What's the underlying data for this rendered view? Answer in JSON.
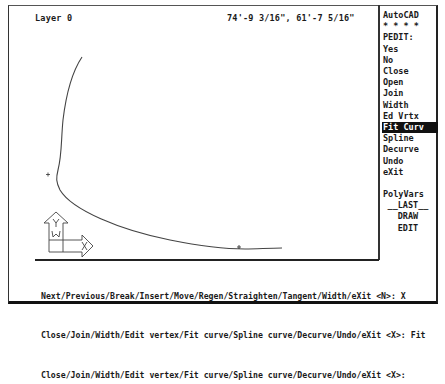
{
  "status_bar": {
    "layer": "Layer 0",
    "coordinates": "74'-9 3/16\", 61'-7 5/16\""
  },
  "side_menu": {
    "title": "AutoCAD",
    "separator": "* * * *",
    "items": [
      {
        "label": "PEDIT:",
        "highlighted": false
      },
      {
        "label": "Yes",
        "highlighted": false
      },
      {
        "label": "No",
        "highlighted": false
      },
      {
        "label": "Close",
        "highlighted": false
      },
      {
        "label": "Open",
        "highlighted": false
      },
      {
        "label": "Join",
        "highlighted": false
      },
      {
        "label": "Width",
        "highlighted": false
      },
      {
        "label": "Ed Vrtx",
        "highlighted": false
      },
      {
        "label": "Fit Curv",
        "highlighted": true
      },
      {
        "label": "Spline",
        "highlighted": false
      },
      {
        "label": "Decurve",
        "highlighted": false
      },
      {
        "label": "Undo",
        "highlighted": false
      },
      {
        "label": "eXit",
        "highlighted": false
      }
    ],
    "footer_items": [
      {
        "label": "PolyVars"
      },
      {
        "label": "__LAST__"
      },
      {
        "label": "DRAW"
      },
      {
        "label": "EDIT"
      }
    ]
  },
  "command_area": {
    "lines": [
      "Next/Previous/Break/Insert/Move/Regen/Straighten/Tangent/Width/eXit <N>: X",
      "Close/Join/Width/Edit vertex/Fit curve/Spline curve/Decurve/Undo/eXit <X>: Fit",
      "Close/Join/Width/Edit vertex/Fit curve/Spline curve/Decurve/Undo/eXit <X>:"
    ]
  },
  "drawing": {
    "ucs_icon": {
      "x_label": "X",
      "y_label": "Y",
      "w_label": "W"
    },
    "entities": [
      "fitted-polyline-curve",
      "point-marker"
    ]
  }
}
